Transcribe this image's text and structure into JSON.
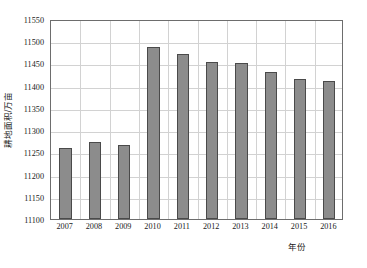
{
  "chart_data": {
    "type": "bar",
    "title": "",
    "xlabel": "年份",
    "ylabel": "耕地面积/万亩",
    "categories": [
      "2007",
      "2008",
      "2009",
      "2010",
      "2011",
      "2012",
      "2013",
      "2014",
      "2015",
      "2016"
    ],
    "values": [
      11260,
      11273,
      11266,
      11488,
      11471,
      11453,
      11450,
      11430,
      11416,
      11410
    ],
    "ylim": [
      11100,
      11550
    ],
    "ytick_labels": [
      "11100",
      "11150",
      "11200",
      "11250",
      "11300",
      "11350",
      "11400",
      "11450",
      "11500",
      "11550"
    ],
    "ytick_values": [
      11100,
      11150,
      11200,
      11250,
      11300,
      11350,
      11400,
      11450,
      11500,
      11550
    ],
    "ytick_interval": 50,
    "grid": true,
    "legend": "none",
    "series_color": "#8c8c8c",
    "series_border_color": "#4a4a4a",
    "grid_color": "#d2d2d2",
    "axis_color": "#6d6d6d",
    "bar_width_ratio": 0.42
  }
}
